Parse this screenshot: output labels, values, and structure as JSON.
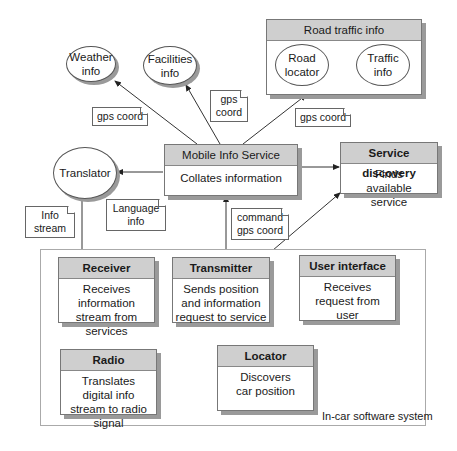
{
  "diagram": {
    "external_services": {
      "weather": "Weather info",
      "facilities": "Facilities info",
      "translator": "Translator",
      "road_traffic": {
        "title": "Road traffic info",
        "road_locator": "Road locator",
        "traffic_info": "Traffic info"
      }
    },
    "mobile_info_service": {
      "title": "Mobile Info Service",
      "description": "Collates information"
    },
    "service_discovery": {
      "title": "Service discovery",
      "description": "Finds available service"
    },
    "in_car_system": {
      "label": "In-car software system",
      "receiver": {
        "title": "Receiver",
        "description": "Receives information stream from services"
      },
      "transmitter": {
        "title": "Transmitter",
        "description": "Sends position and information request to service"
      },
      "user_interface": {
        "title": "User interface",
        "description": "Receives request from user"
      },
      "radio": {
        "title": "Radio",
        "description": "Translates digital info stream to radio signal"
      },
      "locator": {
        "title": "Locator",
        "description": "Discovers car position"
      }
    },
    "messages": {
      "gps_weather": "gps coord",
      "gps_facilities": "gps coord",
      "gps_road": "gps coord",
      "language_info": "Language info",
      "info_stream": "Info stream",
      "command_gps": "command gps coord"
    }
  }
}
